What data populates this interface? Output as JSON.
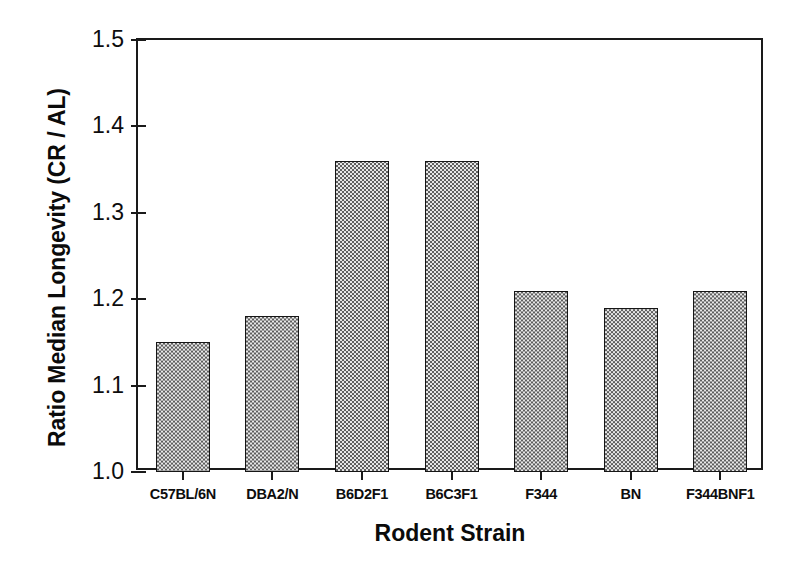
{
  "chart_data": {
    "type": "bar",
    "title": "",
    "xlabel": "Rodent Strain",
    "ylabel": "Ratio Median Longevity (CR / AL)",
    "categories": [
      "C57BL/6N",
      "DBA2/N",
      "B6D2F1",
      "B6C3F1",
      "F344",
      "BN",
      "F344BNF1"
    ],
    "values": [
      1.15,
      1.18,
      1.36,
      1.36,
      1.21,
      1.19,
      1.21
    ],
    "ylim": [
      1.0,
      1.5
    ],
    "ytick_labels": [
      "1.5",
      "1.4",
      "1.3",
      "1.2",
      "1.1",
      "1.0"
    ],
    "ytick_values": [
      1.5,
      1.4,
      1.3,
      1.2,
      1.1,
      1.0
    ],
    "ytick_step": 0.1,
    "grid": false,
    "legend": null,
    "bar_fill": "checkerboard-halftone-gray",
    "bar_edge_color": "#161616",
    "background_color": "#ffffff"
  },
  "axes": {
    "y_title": "Ratio Median Longevity (CR / AL)",
    "x_title": "Rodent Strain"
  }
}
